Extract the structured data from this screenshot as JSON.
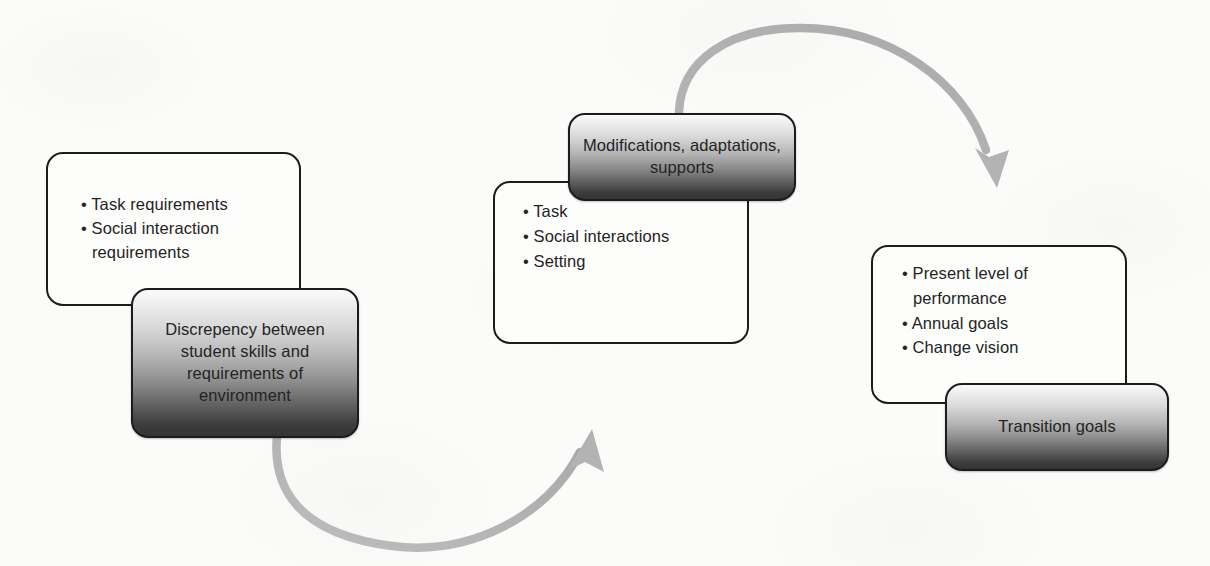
{
  "diagram": {
    "background_color": "#fbfbfa",
    "accent_color": "#b0b0b0",
    "outline_color": "#1c1c1c",
    "text_color": "#242424"
  },
  "nodes": {
    "task_requirements": {
      "id": "task-requirements",
      "style": "white",
      "bullets": [
        "Task requirements",
        "Social interaction requirements"
      ]
    },
    "discrepancy": {
      "id": "discrepancy",
      "style": "shaded",
      "text": "Discrepency between student skills and requirements of environment"
    },
    "task_social_setting": {
      "id": "task-social-setting",
      "style": "white",
      "bullets": [
        "Task",
        "Social interactions",
        "Setting"
      ]
    },
    "modifications": {
      "id": "modifications",
      "style": "shaded",
      "text": "Modifications, adaptations, supports"
    },
    "present_level": {
      "id": "present-level",
      "style": "white",
      "bullets": [
        "Present level of performance",
        "Annual goals",
        "Change vision"
      ]
    },
    "transition_goals": {
      "id": "transition-goals",
      "style": "shaded",
      "text": "Transition goals"
    }
  },
  "arrows": [
    {
      "id": "arrow-discrepancy-to-modifications",
      "from": "discrepancy",
      "to": "task-social-setting",
      "direction": "up-right",
      "color": "#b0b0b0"
    },
    {
      "id": "arrow-modifications-to-present-level",
      "from": "modifications",
      "to": "present-level",
      "direction": "down-right",
      "color": "#b0b0b0"
    }
  ]
}
